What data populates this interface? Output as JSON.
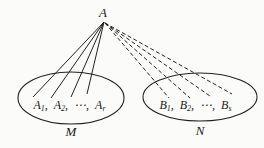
{
  "diagram": {
    "apex": {
      "label": "A"
    },
    "left_group": {
      "set_label": "M",
      "members": [
        {
          "base": "A",
          "sub": "1",
          "sep": ","
        },
        {
          "base": "A",
          "sub": "2",
          "sep": ","
        },
        {
          "base": "⋯",
          "sub": "",
          "sep": ","
        },
        {
          "base": "A",
          "sub": "r",
          "sep": ""
        }
      ],
      "edge_style": "solid"
    },
    "right_group": {
      "set_label": "N",
      "members": [
        {
          "base": "B",
          "sub": "1",
          "sep": ","
        },
        {
          "base": "B",
          "sub": "2",
          "sep": ","
        },
        {
          "base": "⋯",
          "sub": "",
          "sep": ","
        },
        {
          "base": "B",
          "sub": "s",
          "sep": ""
        }
      ],
      "edge_style": "dashed"
    },
    "colors": {
      "line": "#222222",
      "text": "#1a1a1a",
      "background": "#fbfbf9"
    }
  }
}
